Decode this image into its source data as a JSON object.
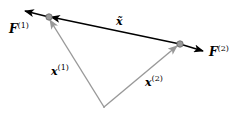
{
  "diagram": {
    "labels": {
      "F1": {
        "base": "F",
        "sup": "(1)"
      },
      "F2": {
        "base": "F",
        "sup": "(2)"
      },
      "x1": {
        "base": "x",
        "sup": "(1)"
      },
      "x2": {
        "base": "x",
        "sup": "(2)"
      },
      "xtilde": {
        "base": "x̃"
      }
    },
    "colors": {
      "force_arrow": "#000000",
      "position_vector": "#999999",
      "point_fill": "#999999",
      "point_stroke": "#666666"
    }
  }
}
